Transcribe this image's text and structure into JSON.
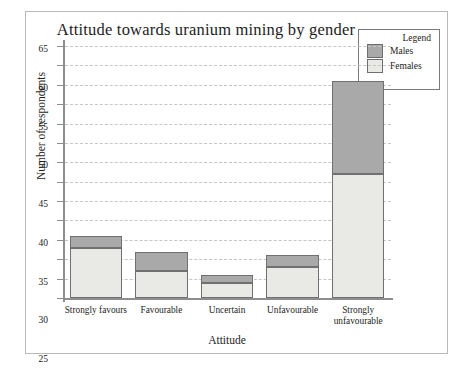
{
  "chart_data": {
    "type": "bar",
    "subtype": "stacked",
    "title": "Attitude towards uranium mining by gender",
    "xlabel": "Attitude",
    "ylabel": "Number of respondents",
    "categories": [
      "Strongly favours",
      "Favourable",
      "Uncertain",
      "Unfavourable",
      "Strongly\nunfavourable"
    ],
    "series": [
      {
        "name": "Females",
        "color": "#e9e9e6",
        "values": [
          13,
          7,
          4,
          8,
          32
        ]
      },
      {
        "name": "Males",
        "color": "#a9a9a9",
        "values": [
          3,
          5,
          2,
          3,
          24
        ]
      }
    ],
    "totals": [
      16,
      12,
      6,
      11,
      56
    ],
    "ylim": [
      0,
      65
    ],
    "ytick_step": 5,
    "yticks": [
      0,
      5,
      10,
      15,
      20,
      25,
      30,
      35,
      40,
      45,
      50,
      55,
      60,
      65
    ],
    "grid": true,
    "grid_style": "dashed",
    "legend_position": "top-right",
    "legend_title": "Legend",
    "legend_entries": [
      "Males",
      "Females"
    ]
  },
  "colors": {
    "males": "#a9a9a9",
    "females": "#e9e9e6",
    "bar_border": "#707070",
    "axis": "#8e8e8e",
    "grid": "#c6c6c6",
    "frame": "#b9b9b9",
    "text": "#1d1d1d"
  }
}
